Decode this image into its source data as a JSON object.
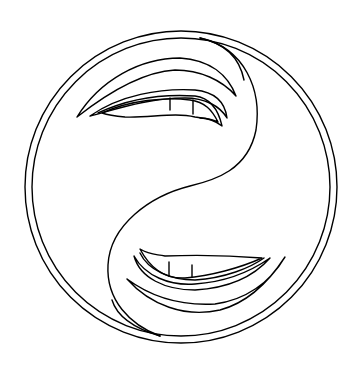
{
  "image": {
    "description": "Line-art yin-yang symbol with an eye in each half",
    "colors": {
      "background": "#ffffff",
      "stroke": "#000000"
    }
  }
}
